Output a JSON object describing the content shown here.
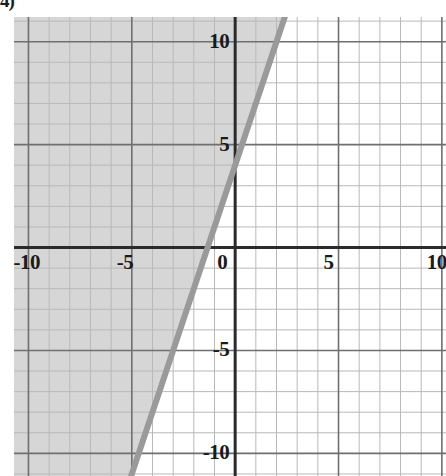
{
  "problem": {
    "label_fragment": "4)"
  },
  "colors": {
    "background": "#ffffff",
    "shade_fill": "#d6d6d6",
    "minor_grid": "#b9b9b9",
    "major_grid": "#6f6f6f",
    "axis": "#2b2b2b",
    "boundary_line": "#9a9a9a",
    "label_text": "#1a1a1a"
  },
  "chart_data": {
    "type": "line",
    "title": "",
    "subtitle": "",
    "xlabel": "",
    "ylabel": "",
    "xlim": [
      -10.7,
      10.2
    ],
    "ylim": [
      -11.1,
      11.2
    ],
    "grid": true,
    "minor_grid_step": 1,
    "major_grid_step": 5,
    "legend": "none",
    "xticks": [
      -10,
      -5,
      0,
      5,
      10
    ],
    "xtick_labels": [
      "-10",
      "-5",
      "0",
      "5",
      "10"
    ],
    "yticks": [
      10,
      5,
      0,
      -5,
      -10
    ],
    "ytick_labels": [
      "10",
      "5",
      "0",
      "-5",
      "-10"
    ],
    "origin_label": "0",
    "series": [
      {
        "name": "boundary-line",
        "kind": "line",
        "style": "solid",
        "slope": 3,
        "intercept": 4,
        "x_intercept": -1.33,
        "equation": "y = 3x + 4",
        "points": [
          {
            "x": -5.05,
            "y": -11.15
          },
          {
            "x": 2.4,
            "y": 11.2
          }
        ]
      }
    ],
    "shaded_region": {
      "name": "solution-region",
      "description": "region to the left of and above the line",
      "inequality": "y > 3x + 4",
      "side": "upper-left",
      "fill": "#d6d6d6"
    },
    "annotations": []
  }
}
